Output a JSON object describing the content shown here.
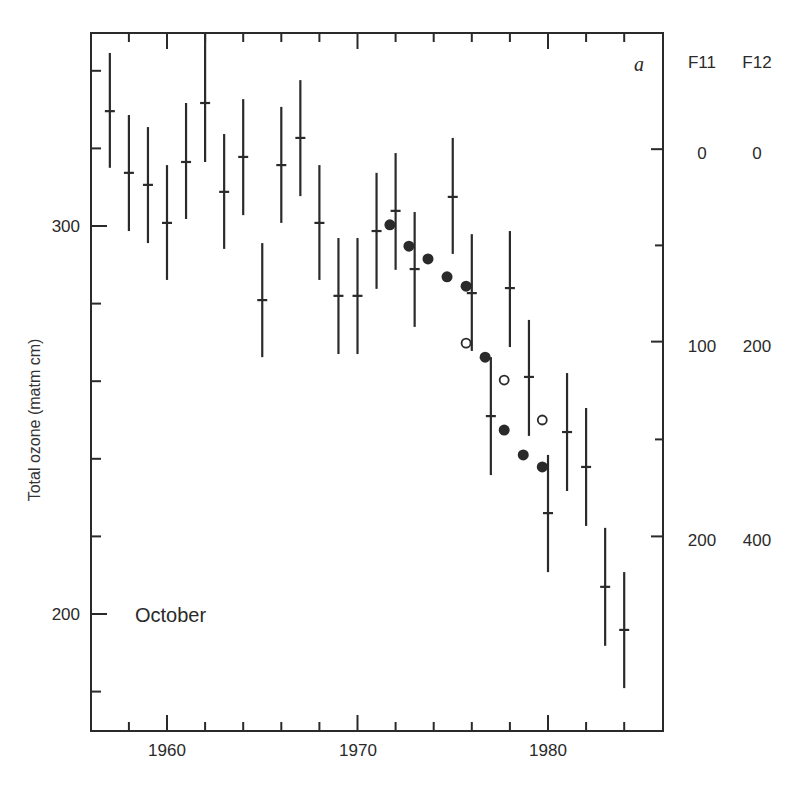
{
  "chart_data": {
    "type": "scatter",
    "title": "",
    "panel_label": "a",
    "annotation": "October",
    "xlabel": "",
    "ylabel": "Total ozone (matm cm)",
    "xlim": [
      1956,
      1986
    ],
    "ylim": [
      170,
      350
    ],
    "x_ticks_major": [
      1960,
      1970,
      1980
    ],
    "x_ticks_minor": [
      1958,
      1962,
      1964,
      1966,
      1968,
      1972,
      1974,
      1976,
      1978,
      1982,
      1984
    ],
    "y_ticks_labeled": [
      200,
      300
    ],
    "y_ticks_minor": [
      180,
      220,
      240,
      260,
      280,
      320,
      340
    ],
    "grid": false,
    "right_axis": {
      "headers": [
        "F11",
        "F12"
      ],
      "rows": [
        {
          "F11": "0",
          "F12": "0",
          "ozone_equiv": 319.8
        },
        {
          "F11": "100",
          "F12": "200",
          "ozone_equiv": 270.2
        },
        {
          "F11": "200",
          "F12": "400",
          "ozone_equiv": 220.0
        }
      ],
      "minor_ticks_ozone_equiv": [
        295.0,
        245.0
      ]
    },
    "series": [
      {
        "name": "Total ozone (monthly mean ± error)",
        "marker": "cross-with-errorbar",
        "x": [
          1957,
          1958,
          1959,
          1960,
          1961,
          1962,
          1963,
          1964,
          1965,
          1966,
          1967,
          1968,
          1969,
          1970,
          1971,
          1972,
          1973,
          1975,
          1976,
          1977,
          1978,
          1979,
          1980,
          1981,
          1982,
          1983,
          1984
        ],
        "y": [
          329.6,
          313.7,
          310.6,
          300.8,
          316.5,
          331.7,
          308.8,
          317.8,
          280.9,
          315.7,
          322.7,
          300.8,
          282.0,
          282.0,
          298.7,
          303.9,
          288.9,
          307.5,
          282.7,
          251.0,
          284.0,
          261.1,
          226.0,
          246.9,
          237.9,
          207.0,
          195.9
        ],
        "y_low": [
          315.0,
          298.7,
          295.6,
          286.1,
          301.8,
          316.5,
          294.1,
          302.8,
          266.2,
          300.8,
          307.7,
          286.1,
          267.0,
          267.0,
          283.8,
          288.7,
          274.0,
          292.8,
          267.8,
          235.8,
          268.8,
          245.9,
          210.8,
          231.7,
          222.7,
          191.8,
          180.9
        ],
        "y_high": [
          344.6,
          328.6,
          325.5,
          315.7,
          331.7,
          349.7,
          323.7,
          332.7,
          295.6,
          330.7,
          337.6,
          315.7,
          296.9,
          296.9,
          313.7,
          318.8,
          303.6,
          322.7,
          297.9,
          266.2,
          298.7,
          275.8,
          241.0,
          262.1,
          253.1,
          222.2,
          210.8
        ]
      },
      {
        "name": "F11/F12 (filled circles)",
        "marker": "filled-circle",
        "x": [
          1971.7,
          1972.7,
          1973.7,
          1974.7,
          1975.7,
          1976.7,
          1977.7,
          1978.7,
          1979.7
        ],
        "y": [
          300.3,
          294.8,
          291.5,
          286.9,
          284.5,
          266.2,
          247.4,
          241.0,
          237.9
        ]
      },
      {
        "name": "F11/F12 (open circles)",
        "marker": "open-circle",
        "x": [
          1975.7,
          1977.7,
          1979.7
        ],
        "y": [
          269.8,
          260.3,
          250.0
        ]
      }
    ]
  },
  "labels": {
    "x_1960": "1960",
    "x_1970": "1970",
    "x_1980": "1980",
    "y_300": "300",
    "y_200": "200",
    "ylabel": "Total ozone (matm cm)",
    "panel": "a",
    "month": "October",
    "right_h1": "F11",
    "right_h2": "F12",
    "r0_f11": "0",
    "r0_f12": "0",
    "r1_f11": "100",
    "r1_f12": "200",
    "r2_f11": "200",
    "r2_f12": "400"
  },
  "colors": {
    "ink": "#2a2a2a",
    "background": "#ffffff"
  }
}
